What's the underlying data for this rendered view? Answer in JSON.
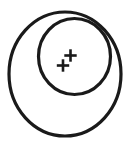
{
  "figure": {
    "title": "Concentric offset circles with two plus marks",
    "canvas": {
      "width": 138,
      "height": 150,
      "background_color": "#ffffff"
    },
    "stroke_color": "#1a1a1a",
    "fill_color": "#ffffff",
    "shapes": {
      "outer_circle": {
        "label": "outer circle",
        "cx": 65,
        "cy": 74,
        "rx": 56,
        "ry": 62,
        "stroke_width": 3.2
      },
      "inner_circle": {
        "label": "inner circle",
        "cx": 74.5,
        "cy": 56.5,
        "rx": 36,
        "ry": 38,
        "stroke_width": 3.2
      }
    },
    "marks": [
      {
        "label": "upper plus mark",
        "glyph": "plus",
        "cx": 70.5,
        "cy": 55.5,
        "arm": 6.2,
        "thickness": 2.6
      },
      {
        "label": "lower plus mark",
        "glyph": "plus",
        "cx": 63.0,
        "cy": 65.5,
        "arm": 6.2,
        "thickness": 2.6
      }
    ]
  }
}
